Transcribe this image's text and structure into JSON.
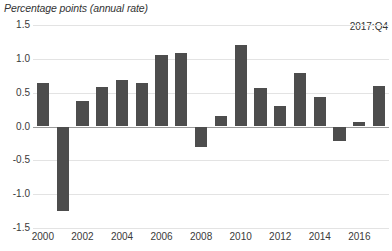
{
  "chart": {
    "axis_title": "Percentage points (annual rate)",
    "annotation": "2017:Q4"
  },
  "chart_data": {
    "type": "bar",
    "title": "Percentage points (annual rate)",
    "xlabel": "",
    "ylabel": "Percentage points (annual rate)",
    "ylim": [
      -1.5,
      1.5
    ],
    "ytick_labels": [
      "1.5",
      "1.0",
      "0.5",
      "0.0",
      "-0.5",
      "-1.0",
      "-1.5"
    ],
    "ytick_values": [
      1.5,
      1.0,
      0.5,
      0.0,
      -0.5,
      -1.0,
      -1.5
    ],
    "xtick_labels": [
      "2000",
      "2002",
      "2004",
      "2006",
      "2008",
      "2010",
      "2012",
      "2014",
      "2016"
    ],
    "xtick_values": [
      2000,
      2002,
      2004,
      2006,
      2008,
      2010,
      2012,
      2014,
      2016
    ],
    "grid": true,
    "legend": null,
    "annotations": [
      {
        "text": "2017:Q4",
        "position": "top-right"
      }
    ],
    "bar_color": "#4d4d4d",
    "categories": [
      2000,
      2001,
      2002,
      2003,
      2004,
      2005,
      2006,
      2007,
      2008,
      2009,
      2010,
      2011,
      2012,
      2013,
      2014,
      2015,
      2016,
      2017
    ],
    "values": [
      0.65,
      -1.25,
      0.38,
      0.58,
      0.68,
      0.64,
      1.05,
      1.08,
      -0.3,
      0.15,
      1.2,
      0.57,
      0.31,
      0.79,
      0.43,
      -0.21,
      0.06,
      0.6
    ]
  }
}
